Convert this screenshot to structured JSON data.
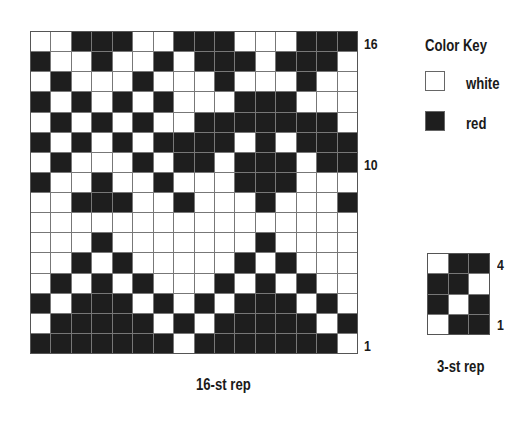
{
  "chart": {
    "caption": "16-st rep",
    "row_labels": {
      "top": "16",
      "middle": "10",
      "bottom": "1"
    },
    "columns": 16,
    "rows_top_to_bottom": [
      "WWRRRWWRRRWWWRRR",
      "RWWRWWRWRRRWRRRW",
      "WRWWWRWWWRWWWRWW",
      "RWRWRWRWWWRRRWWW",
      "WRWRWRWWRRRRRRRW",
      "RWRWRWRRRRWRWRRR",
      "WRWWWRWRRWRRRWRR",
      "RWWRWWRWWWRRRWWW",
      "WWRRRWWRWWWRWWWR",
      "WWWWWWWWWWWWWWWW",
      "WWWRWWWWWWWRWWWW",
      "WWRWRWWWWWRWRWWW",
      "WRWRWRWWWRWRWRWW",
      "RWRRRWRWRWRRRWRW",
      "WRRRRRWRWRRRRRWR",
      "RRRRRRRWRRRRRRRW"
    ]
  },
  "rep_chart": {
    "caption": "3-st rep",
    "row_labels": {
      "top": "4",
      "bottom": "1"
    },
    "columns": 3,
    "rows_top_to_bottom": [
      "WRR",
      "RRW",
      "RWR",
      "WRR"
    ]
  },
  "color_key": {
    "title": "Color Key",
    "items": [
      {
        "symbol": "W",
        "label": "white",
        "color": "#ffffff"
      },
      {
        "symbol": "R",
        "label": "red",
        "color": "#1e1e1e"
      }
    ]
  }
}
